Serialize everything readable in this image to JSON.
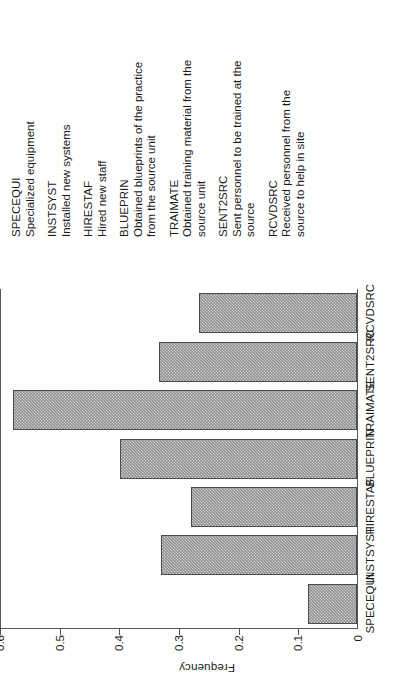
{
  "chart_data": {
    "type": "bar",
    "title": "",
    "subtitle": "",
    "xlabel": "",
    "ylabel": "Frequency",
    "categories": [
      "SPECEQUI",
      "INSTSYST",
      "HIRESTAF",
      "BLUEPRIN",
      "TRAIMATE",
      "SENT2SRC",
      "RCVDSRC"
    ],
    "values": [
      0.082,
      0.331,
      0.279,
      0.4,
      0.579,
      0.333,
      0.267
    ],
    "ylim": [
      0,
      0.6
    ],
    "ytick_labels": [
      "0",
      "0.1",
      "0.2",
      "0.3",
      "0.4",
      "0.5",
      "0.6"
    ],
    "ytick_values": [
      0,
      0.1,
      0.2,
      0.3,
      0.4,
      0.5,
      0.6
    ],
    "grid": false,
    "legend_position": "right",
    "bar_fill": "#8e8e8e",
    "bar_edge": "#4a4a4a",
    "axis_color": "#555555",
    "background": "#ffffff",
    "orientation": "vertical",
    "rotation_deg": -90
  },
  "legend": {
    "entries": [
      {
        "code": "SPECEQUI",
        "description": "Specialized equipment"
      },
      {
        "code": "INSTSYST",
        "description": "Installed new systems"
      },
      {
        "code": "HIRESTAF",
        "description": "Hired new staff"
      },
      {
        "code": "BLUEPRIN",
        "description": "Obtained blueprints of the practice from the source unit"
      },
      {
        "code": "TRAIMATE",
        "description": "Obtained training material from the source unit"
      },
      {
        "code": "SENT2SRC",
        "description": "Sent personnel to be trained at the source"
      },
      {
        "code": "RCVDSRC",
        "description": "Received personnel from the source to help in site"
      }
    ]
  }
}
